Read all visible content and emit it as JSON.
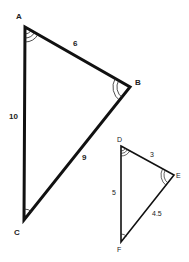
{
  "diagram": {
    "type": "similar-triangles",
    "colors": {
      "stroke": "#111111",
      "background": "#ffffff",
      "text": "#222222"
    },
    "triangle_large": {
      "vertices": [
        {
          "label": "A",
          "x": 25,
          "y": 27,
          "angle_arcs": 3
        },
        {
          "label": "B",
          "x": 130,
          "y": 87,
          "angle_arcs": 2
        },
        {
          "label": "C",
          "x": 24,
          "y": 220,
          "angle_arcs": 1
        }
      ],
      "sides": [
        {
          "name": "AB",
          "length": "6"
        },
        {
          "name": "BC",
          "length": "9"
        },
        {
          "name": "AC",
          "length": "10"
        }
      ]
    },
    "triangle_small": {
      "vertices": [
        {
          "label": "D",
          "x": 121,
          "y": 146,
          "angle_arcs": 3
        },
        {
          "label": "E",
          "x": 174,
          "y": 175,
          "angle_arcs": 2
        },
        {
          "label": "F",
          "x": 121,
          "y": 242,
          "angle_arcs": 1
        }
      ],
      "sides": [
        {
          "name": "DE",
          "length": "3"
        },
        {
          "name": "EF",
          "length": "4.5"
        },
        {
          "name": "DF",
          "length": "5"
        }
      ]
    }
  }
}
